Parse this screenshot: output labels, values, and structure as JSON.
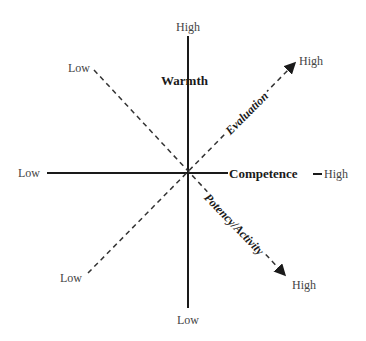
{
  "diagram": {
    "type": "dimension-axes",
    "axes": {
      "vertical": {
        "name": "Warmth",
        "low": "Low",
        "high": "High",
        "style": "solid"
      },
      "horizontal": {
        "name": "Competence",
        "low": "Low",
        "high": "High",
        "style": "solid"
      },
      "diagonal_up": {
        "name": "Evaluation",
        "low": "Low",
        "high": "High",
        "style": "dashed-arrow"
      },
      "diagonal_down": {
        "name": "Potency/Activity",
        "low": "Low",
        "high": "High",
        "style": "dashed-arrow"
      }
    },
    "colors": {
      "line": "#1a1a1a",
      "text": "#444444"
    }
  }
}
